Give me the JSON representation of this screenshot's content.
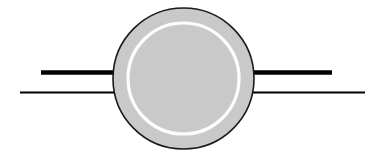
{
  "figure": {
    "title": "Schematic cross-section of a ring-shaped hub with two horizontal leads",
    "canvas": {
      "width": 385,
      "height": 158,
      "background_color": "#ffffff"
    },
    "outer_circle": {
      "name": "outer-disc",
      "center_x": 183.5,
      "center_y": 78.5,
      "radius": 70.5,
      "fill_color": "#c9c9c9",
      "stroke_color": "#1a1a1a",
      "stroke_width": 1.6
    },
    "inner_ring": {
      "name": "inner-ring",
      "center_x": 183.5,
      "center_y": 78.5,
      "radius": 55.5,
      "fill_color": "none",
      "stroke_color": "#fdfdfd",
      "stroke_width": 3.2
    },
    "lines": [
      {
        "name": "upper-thick-lead",
        "label": "upper thick lead",
        "x1": 41,
        "y1": 72.5,
        "x2": 332,
        "y2": 72.5,
        "stroke_color": "#000000",
        "stroke_width": 4.6,
        "weight": "thick"
      },
      {
        "name": "lower-thin-lead",
        "label": "lower thin lead",
        "x1": 20,
        "y1": 92.5,
        "x2": 365,
        "y2": 92.5,
        "stroke_color": "#000000",
        "stroke_width": 2.0,
        "weight": "thin"
      }
    ],
    "z_order": [
      "lines",
      "outer_circle",
      "inner_ring"
    ]
  }
}
